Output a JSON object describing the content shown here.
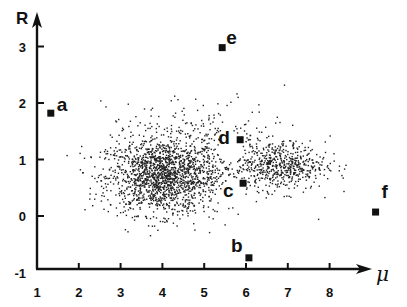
{
  "chart_data": {
    "type": "scatter",
    "title": "",
    "xlabel": "μ",
    "ylabel": "R",
    "xlim": [
      1,
      9.3
    ],
    "ylim": [
      -1,
      3.3
    ],
    "xticks": [
      2,
      3,
      4,
      5,
      6,
      7,
      8
    ],
    "xtick_labels": [
      "1",
      "2",
      "3",
      "4",
      "5",
      "6",
      "7",
      "8"
    ],
    "yticks": [
      -1,
      0,
      1,
      2,
      3
    ],
    "ytick_labels": [
      "-1",
      "0",
      "1",
      "2",
      "3"
    ],
    "grid": false,
    "legend": null,
    "labeled_points": [
      {
        "label": "a",
        "x": 1.33,
        "y": 1.82
      },
      {
        "label": "b",
        "x": 6.07,
        "y": -0.74
      },
      {
        "label": "c",
        "x": 5.93,
        "y": 0.58
      },
      {
        "label": "d",
        "x": 5.86,
        "y": 1.35
      },
      {
        "label": "e",
        "x": 5.43,
        "y": 2.98
      },
      {
        "label": "f",
        "x": 9.1,
        "y": 0.07
      }
    ],
    "background_cloud": {
      "description": "Dense scatter of small dots forming a horizontal elongated cloud",
      "clusters": [
        {
          "center_x": 4.0,
          "center_y": 0.7,
          "spread_x": 1.1,
          "spread_y": 0.55,
          "count": 1500
        },
        {
          "center_x": 6.8,
          "center_y": 0.9,
          "spread_x": 0.9,
          "spread_y": 0.35,
          "count": 500
        },
        {
          "center_x": 5.0,
          "center_y": 1.1,
          "spread_x": 2.0,
          "spread_y": 0.75,
          "count": 500
        }
      ],
      "extent_x": [
        1.6,
        8.9
      ],
      "extent_y": [
        -0.55,
        2.65
      ]
    }
  },
  "axes": {
    "x_label": "μ",
    "y_label": "R",
    "x_tick_labels": [
      "1",
      "2",
      "3",
      "4",
      "5",
      "6",
      "7",
      "8"
    ],
    "y_tick_labels": [
      "-1",
      "0",
      "1",
      "2",
      "3"
    ]
  },
  "points": [
    {
      "label": "a"
    },
    {
      "label": "b"
    },
    {
      "label": "c"
    },
    {
      "label": "d"
    },
    {
      "label": "e"
    },
    {
      "label": "f"
    }
  ]
}
